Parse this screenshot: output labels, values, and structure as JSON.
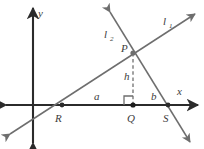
{
  "figure": {
    "background_color": "#ffffff",
    "axis_color": "#2b2b2b",
    "line_color": "#6e6e6e",
    "label_color": "#3c3c3c",
    "dash_color": "#8a8a8a"
  },
  "axes": {
    "x_label": "x",
    "y_label": "y",
    "origin": {
      "x": 33,
      "y": 105
    }
  },
  "lines": [
    {
      "id": "l1",
      "label": "l",
      "subscript": "1",
      "label_x": 163,
      "label_y": 25,
      "from": {
        "x": 10,
        "y": 134
      },
      "to": {
        "x": 195,
        "y": 14
      },
      "arrows": "both"
    },
    {
      "id": "l2",
      "label": "l",
      "subscript": "2",
      "label_x": 104,
      "label_y": 38,
      "from": {
        "x": 110,
        "y": 12
      },
      "to": {
        "x": 190,
        "y": 142
      },
      "arrows": "both"
    }
  ],
  "points": [
    {
      "name": "P",
      "label": "P",
      "x": 133,
      "y": 53,
      "label_x": 121,
      "label_y": 52
    },
    {
      "name": "R",
      "label": "R",
      "x": 62,
      "y": 105,
      "label_x": 55,
      "label_y": 122
    },
    {
      "name": "Q",
      "label": "Q",
      "x": 133,
      "y": 105,
      "label_x": 127,
      "label_y": 122
    },
    {
      "name": "S",
      "label": "S",
      "x": 168,
      "y": 105,
      "label_x": 163,
      "label_y": 122
    }
  ],
  "segments": [
    {
      "name": "a",
      "label": "a",
      "label_x": 94,
      "label_y": 100,
      "description": "segment from R to Q"
    },
    {
      "name": "b",
      "label": "b",
      "label_x": 151,
      "label_y": 100,
      "description": "segment from Q to S"
    },
    {
      "name": "h",
      "label": "h",
      "label_x": 124,
      "label_y": 80,
      "description": "dashed altitude from P to Q"
    }
  ],
  "right_angle": {
    "at_point": "Q",
    "x": 133,
    "y": 105,
    "size": 9
  }
}
